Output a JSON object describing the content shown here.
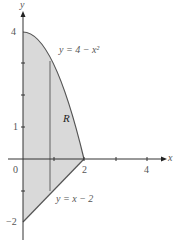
{
  "axes": {
    "x_label": "x",
    "y_label": "y"
  },
  "ticks": {
    "x": [
      {
        "value": 0,
        "label": "0"
      },
      {
        "value": 2,
        "label": "2"
      },
      {
        "value": 4,
        "label": "4"
      }
    ],
    "y": [
      {
        "value": 4,
        "label": "4"
      },
      {
        "value": 1,
        "label": "1"
      },
      {
        "value": -2,
        "label": "−2"
      }
    ]
  },
  "curves": {
    "upper": "y = 4 − x²",
    "lower": "y = x − 2"
  },
  "region_label": "R",
  "colors": {
    "fill": "#d9d9d9",
    "line": "#555555",
    "axis": "#333333"
  }
}
